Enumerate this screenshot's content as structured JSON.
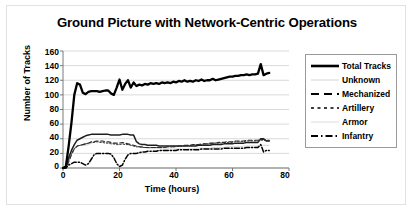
{
  "chart_data": {
    "type": "line",
    "title": "Ground Picture with Network-Centric Operations",
    "xlabel": "Time (hours)",
    "ylabel": "Number of Tracks",
    "xlim": [
      0,
      80
    ],
    "ylim": [
      0,
      160
    ],
    "xticks": [
      "0",
      "20",
      "40",
      "60",
      "80"
    ],
    "yticks": [
      "0",
      "20",
      "40",
      "60",
      "80",
      "100",
      "120",
      "140",
      "160"
    ],
    "grid": "horizontal",
    "legend_position": "right",
    "legend": [
      {
        "label": "Total Tracks",
        "style": "solid-thick",
        "color": "#000000"
      },
      {
        "label": "Unknown",
        "style": "solid-faint",
        "color": "#d0d0d0"
      },
      {
        "label": "Mechanized",
        "style": "dashed",
        "color": "#000000"
      },
      {
        "label": "Artillery",
        "style": "dotted",
        "color": "#000000"
      },
      {
        "label": "Armor",
        "style": "solid-faint",
        "color": "#d8d8d8"
      },
      {
        "label": "Infantry",
        "style": "dash-dot",
        "color": "#000000"
      }
    ],
    "x": [
      0,
      1,
      2,
      3,
      4,
      5,
      6,
      7,
      8,
      9,
      10,
      11,
      12,
      13,
      14,
      15,
      16,
      17,
      18,
      19,
      20,
      21,
      22,
      23,
      24,
      25,
      26,
      27,
      28,
      29,
      30,
      31,
      32,
      33,
      34,
      35,
      36,
      37,
      38,
      39,
      40,
      41,
      42,
      43,
      44,
      45,
      46,
      47,
      48,
      49,
      50,
      51,
      52,
      53,
      54,
      55,
      56,
      57,
      58,
      59,
      60,
      61,
      62,
      63,
      64,
      65,
      66,
      67,
      68,
      69,
      70,
      71,
      72,
      73
    ],
    "series": [
      {
        "name": "Total Tracks",
        "values": [
          0,
          2,
          30,
          62,
          100,
          116,
          114,
          103,
          101,
          104,
          105,
          105,
          105,
          104,
          105,
          106,
          106,
          102,
          100,
          110,
          121,
          107,
          115,
          120,
          110,
          117,
          112,
          114,
          113,
          115,
          114,
          116,
          115,
          116,
          115,
          117,
          116,
          117,
          116,
          118,
          117,
          119,
          118,
          120,
          118,
          119,
          118,
          120,
          119,
          121,
          119,
          120,
          120,
          122,
          120,
          121,
          122,
          123,
          124,
          125,
          125,
          126,
          126,
          127,
          127,
          128,
          127,
          128,
          128,
          129,
          142,
          127,
          129,
          130
        ]
      },
      {
        "name": "Unknown",
        "values": [
          0,
          0,
          12,
          22,
          28,
          30,
          31,
          31,
          31,
          32,
          34,
          35,
          36,
          36,
          36,
          35,
          35,
          34,
          33,
          33,
          32,
          33,
          33,
          32,
          31,
          30,
          29,
          29,
          28,
          28,
          27,
          27,
          27,
          27,
          27,
          26,
          26,
          26,
          26,
          26,
          26,
          26,
          26,
          26,
          26,
          26,
          26,
          27,
          27,
          27,
          27,
          27,
          27,
          28,
          28,
          28,
          28,
          28,
          29,
          29,
          29,
          29,
          29,
          29,
          30,
          30,
          30,
          30,
          30,
          30,
          31,
          31,
          31,
          31
        ]
      },
      {
        "name": "Mechanized",
        "values": [
          0,
          0,
          8,
          18,
          26,
          30,
          31,
          32,
          33,
          34,
          36,
          36,
          37,
          37,
          37,
          36,
          36,
          35,
          34,
          34,
          34,
          35,
          34,
          33,
          32,
          31,
          30,
          29,
          29,
          28,
          28,
          28,
          28,
          28,
          28,
          28,
          28,
          29,
          29,
          29,
          30,
          30,
          30,
          31,
          31,
          31,
          32,
          32,
          32,
          33,
          33,
          33,
          34,
          34,
          34,
          35,
          35,
          35,
          36,
          36,
          36,
          37,
          37,
          37,
          37,
          38,
          38,
          38,
          38,
          38,
          39,
          39,
          38,
          38
        ]
      },
      {
        "name": "Artillery",
        "values": [
          0,
          0,
          10,
          20,
          26,
          30,
          31,
          32,
          33,
          34,
          35,
          35,
          36,
          35,
          35,
          34,
          34,
          33,
          33,
          32,
          32,
          33,
          32,
          32,
          31,
          30,
          29,
          29,
          28,
          28,
          28,
          28,
          28,
          28,
          28,
          28,
          28,
          29,
          29,
          29,
          29,
          30,
          30,
          30,
          31,
          31,
          31,
          32,
          32,
          32,
          33,
          33,
          33,
          34,
          34,
          34,
          34,
          35,
          35,
          35,
          35,
          36,
          36,
          36,
          36,
          37,
          37,
          37,
          37,
          37,
          38,
          38,
          37,
          37
        ]
      },
      {
        "name": "Armor",
        "values": [
          0,
          0,
          14,
          24,
          32,
          38,
          40,
          42,
          44,
          45,
          46,
          46,
          46,
          46,
          46,
          46,
          46,
          45,
          45,
          45,
          45,
          46,
          46,
          46,
          45,
          45,
          36,
          33,
          32,
          32,
          31,
          31,
          31,
          31,
          30,
          30,
          30,
          30,
          30,
          30,
          30,
          30,
          30,
          30,
          30,
          30,
          30,
          30,
          31,
          31,
          31,
          31,
          31,
          32,
          32,
          32,
          32,
          33,
          33,
          33,
          33,
          34,
          34,
          34,
          34,
          35,
          35,
          35,
          35,
          35,
          40,
          40,
          37,
          37
        ]
      },
      {
        "name": "Infantry",
        "values": [
          0,
          0,
          4,
          6,
          8,
          8,
          8,
          6,
          4,
          6,
          12,
          18,
          20,
          20,
          20,
          20,
          20,
          19,
          14,
          6,
          2,
          4,
          12,
          18,
          20,
          20,
          20,
          21,
          22,
          22,
          23,
          23,
          23,
          23,
          24,
          24,
          24,
          24,
          24,
          24,
          24,
          25,
          25,
          25,
          25,
          25,
          25,
          25,
          25,
          26,
          26,
          26,
          26,
          26,
          26,
          26,
          26,
          27,
          27,
          27,
          27,
          27,
          27,
          27,
          27,
          28,
          28,
          28,
          28,
          28,
          32,
          22,
          24,
          24
        ]
      }
    ]
  }
}
